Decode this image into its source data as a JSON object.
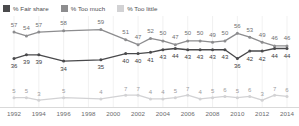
{
  "legend": {
    "items": [
      {
        "label": "% Fair share",
        "color": "#4a4a4c",
        "key": "fair_share"
      },
      {
        "label": "% Too much",
        "color": "#8d8d8f",
        "key": "too_much"
      },
      {
        "label": "% Too little",
        "color": "#d2d2d4",
        "key": "too_little"
      }
    ]
  },
  "chart_data": {
    "type": "line",
    "title": "",
    "subtitle": "",
    "xlabel": "",
    "ylabel": "",
    "grid": true,
    "gridlines": "vertical",
    "legend_position": "top-left",
    "ylim": [
      0,
      65
    ],
    "xlim": [
      1992,
      2014
    ],
    "x": [
      1992,
      1993,
      1994,
      1995,
      1996,
      1997,
      1998,
      1999,
      2000,
      2001,
      2002,
      2003,
      2004,
      2005,
      2006,
      2007,
      2008,
      2009,
      2010,
      2011,
      2012,
      2013,
      2014
    ],
    "tick_labels": [
      "1992",
      "1994",
      "1996",
      "1998",
      "2000",
      "2002",
      "2004",
      "2006",
      "2008",
      "2010",
      "2012",
      "2014"
    ],
    "tick_values": [
      1992,
      1994,
      1996,
      1998,
      2000,
      2002,
      2004,
      2006,
      2008,
      2010,
      2012,
      2014
    ],
    "series": [
      {
        "name": "% Too much",
        "color": "#8d8d8f",
        "x": [
          1992,
          1993,
          1994,
          1996,
          1999,
          2001,
          2002,
          2003,
          2004,
          2005,
          2006,
          2007,
          2008,
          2009,
          2010,
          2011,
          2012,
          2013,
          2014
        ],
        "values": [
          57,
          54,
          57,
          58,
          59,
          51,
          47,
          52,
          50,
          47,
          50,
          50,
          49,
          50,
          56,
          53,
          49,
          46,
          46
        ]
      },
      {
        "name": "% Fair share",
        "color": "#4a4a4c",
        "x": [
          1992,
          1993,
          1994,
          1996,
          1999,
          2001,
          2002,
          2003,
          2004,
          2005,
          2006,
          2007,
          2008,
          2009,
          2010,
          2011,
          2012,
          2013,
          2014
        ],
        "values": [
          36,
          39,
          39,
          34,
          35,
          40,
          40,
          41,
          43,
          44,
          43,
          43,
          43,
          43,
          36,
          42,
          42,
          44,
          44
        ]
      },
      {
        "name": "% Too little",
        "color": "#d2d2d4",
        "x": [
          1992,
          1993,
          1994,
          1996,
          1999,
          2001,
          2002,
          2003,
          2004,
          2005,
          2006,
          2007,
          2008,
          2009,
          2010,
          2011,
          2012,
          2013,
          2014
        ],
        "values": [
          5,
          5,
          3,
          5,
          4,
          7,
          7,
          4,
          4,
          5,
          7,
          4,
          5,
          6,
          5,
          6,
          3,
          7,
          6
        ]
      }
    ],
    "point_labels": {
      "too_much": [
        "57",
        "54",
        "57",
        "58",
        "59",
        "51",
        "47",
        "52",
        "50",
        "47",
        "50",
        "50",
        "49",
        "50",
        "56",
        "53",
        "49",
        "46"
      ],
      "fair_share": [
        "36",
        "39",
        "39",
        "34",
        "35",
        "40",
        "40",
        "41",
        "43",
        "44",
        "43",
        "43",
        "43",
        "43",
        "36",
        "42",
        "42",
        "44"
      ],
      "too_little": [
        "5",
        "5",
        "3",
        "5",
        "4",
        "7",
        "7",
        "4",
        "4",
        "5",
        "7",
        "4",
        "5",
        "6",
        "5",
        "6",
        "3",
        "7",
        "6"
      ]
    }
  }
}
